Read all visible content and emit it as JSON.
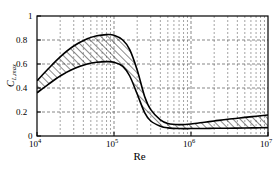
{
  "chart_data": {
    "type": "area",
    "title": "",
    "subtitle": "",
    "xlabel": "Re",
    "ylabel": "C_L,max",
    "ylabel_base": "C",
    "ylabel_sub": "L,max",
    "xscale": "log",
    "yscale": "linear",
    "xlim": [
      10000,
      10000000
    ],
    "ylim": [
      0,
      1
    ],
    "grid": true,
    "grid_style": "dashed minor log gridlines, dashed horizontal gridlines at major y ticks",
    "legend": "none",
    "band_fill": "diagonal-hatch",
    "hatch_direction": "45deg-up-right",
    "line_color": "#000000",
    "grid_color": "#555555",
    "frame_color": "#000000",
    "background": "#ffffff",
    "xticks": [
      10000,
      100000,
      1000000,
      10000000
    ],
    "xtick_labels": [
      "10⁴",
      "10⁵",
      "10⁶",
      "10⁷"
    ],
    "xtick_bases": [
      "10",
      "10",
      "10",
      "10"
    ],
    "xtick_exponents": [
      "4",
      "5",
      "6",
      "7"
    ],
    "yticks": [
      0,
      0.2,
      0.4,
      0.6,
      0.8,
      1
    ],
    "ytick_labels": [
      "0",
      "0.2",
      "0.4",
      "0.6",
      "0.8",
      "1"
    ],
    "series": [
      {
        "name": "upper bound",
        "x": [
          10000,
          14000,
          20000,
          30000,
          45000,
          60000,
          80000,
          100000,
          130000,
          160000,
          200000,
          250000,
          300000,
          400000,
          500000,
          700000,
          1000000,
          1500000,
          2000000,
          3000000,
          5000000,
          7000000,
          10000000
        ],
        "y": [
          0.46,
          0.56,
          0.66,
          0.75,
          0.81,
          0.835,
          0.845,
          0.84,
          0.8,
          0.72,
          0.55,
          0.33,
          0.22,
          0.135,
          0.105,
          0.095,
          0.1,
          0.115,
          0.125,
          0.14,
          0.155,
          0.165,
          0.175
        ]
      },
      {
        "name": "lower bound",
        "x": [
          10000,
          14000,
          20000,
          30000,
          45000,
          60000,
          80000,
          100000,
          130000,
          160000,
          200000,
          250000,
          300000,
          400000,
          500000,
          700000,
          1000000,
          1500000,
          2000000,
          3000000,
          5000000,
          7000000,
          10000000
        ],
        "y": [
          0.36,
          0.43,
          0.5,
          0.56,
          0.6,
          0.615,
          0.62,
          0.615,
          0.58,
          0.5,
          0.35,
          0.195,
          0.125,
          0.082,
          0.068,
          0.062,
          0.062,
          0.063,
          0.064,
          0.065,
          0.067,
          0.068,
          0.07
        ]
      }
    ],
    "annotations": []
  }
}
